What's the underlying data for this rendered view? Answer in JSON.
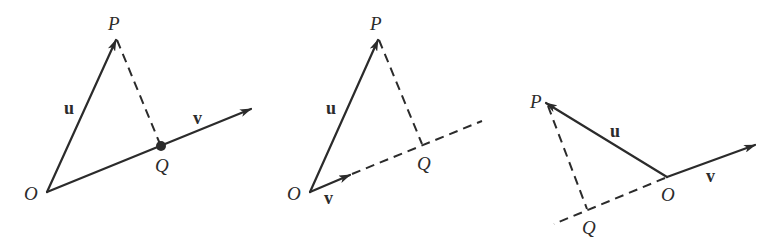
{
  "colors": {
    "ink": "#2b2b2b",
    "background": "#ffffff"
  },
  "diagrams": [
    {
      "labels": {
        "O": "O",
        "P": "P",
        "Q": "Q",
        "u": "u",
        "v": "v"
      },
      "note": "Q lies on v (dot)"
    },
    {
      "labels": {
        "O": "O",
        "P": "P",
        "Q": "Q",
        "u": "u",
        "v": "v"
      },
      "note": "Q on extension of v (dashed)"
    },
    {
      "labels": {
        "O": "O",
        "P": "P",
        "Q": "Q",
        "u": "u",
        "v": "v"
      },
      "note": "Q on backward extension of v (dashed)"
    }
  ]
}
